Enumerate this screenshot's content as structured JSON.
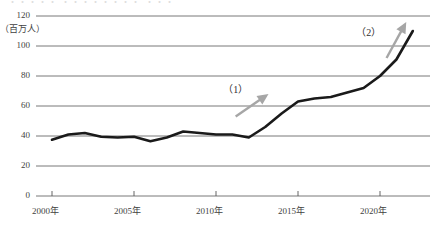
{
  "figure": {
    "top_cut_text": "・・・・・ ・・・・・・・・ ・・・",
    "unit_label": "（百万人）"
  },
  "chart_data": {
    "type": "line",
    "title": "",
    "subtitle": "",
    "xlabel": "",
    "ylabel": "（百万人）",
    "grid": true,
    "legend": "none",
    "xlim": [
      2000,
      2022.5
    ],
    "ylim": [
      0,
      120
    ],
    "ytick_labels": [
      "120",
      "100",
      "80",
      "60",
      "40",
      "20",
      "0"
    ],
    "ytick_values": [
      120,
      100,
      80,
      60,
      40,
      20,
      0
    ],
    "xtick_labels": [
      "2000年",
      "2005年",
      "2010年",
      "2015年",
      "2020年"
    ],
    "xtick_values": [
      2000,
      2005,
      2010,
      2015,
      2020
    ],
    "x": [
      2000,
      2001,
      2002,
      2003,
      2004,
      2005,
      2006,
      2007,
      2008,
      2009,
      2010,
      2011,
      2012,
      2013,
      2014,
      2015,
      2016,
      2017,
      2018,
      2019,
      2020,
      2021,
      2022
    ],
    "values": [
      37.5,
      41,
      42,
      39.5,
      39,
      39.5,
      36.5,
      39,
      43,
      42,
      41,
      41,
      39,
      46,
      55,
      63,
      65,
      66,
      69,
      72,
      80,
      91,
      110
    ],
    "series": [
      {
        "name": "訪日外国人数",
        "color": "#1a1a1a",
        "values": [
          37.5,
          41,
          42,
          39.5,
          39,
          39.5,
          36.5,
          39,
          43,
          42,
          41,
          41,
          39,
          46,
          55,
          63,
          65,
          66,
          69,
          72,
          80,
          91,
          110
        ]
      }
    ],
    "annotations": [
      {
        "label": "（1）",
        "label_x": 2011.3,
        "label_y": 72,
        "arrow_from_x": 2011.2,
        "arrow_from_y": 53,
        "arrow_to_x": 2013.2,
        "arrow_to_y": 68,
        "color": "#a6a6a6"
      },
      {
        "label": "（2）",
        "label_x": 2019.4,
        "label_y": 110,
        "arrow_from_x": 2020.4,
        "arrow_from_y": 92,
        "arrow_to_x": 2021.6,
        "arrow_to_y": 116,
        "color": "#a6a6a6"
      }
    ]
  },
  "colors": {
    "line": "#1a1a1a",
    "grid": "#555555",
    "arrow": "#a6a6a6",
    "text": "#3f3f3f",
    "background": "#ffffff"
  }
}
